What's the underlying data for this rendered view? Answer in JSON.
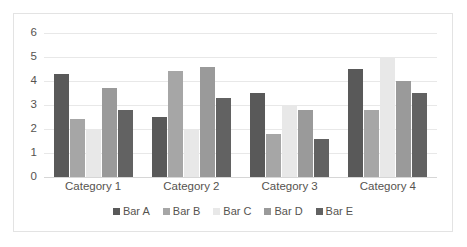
{
  "chart_data": {
    "type": "bar",
    "title": "",
    "subtitle": "",
    "xlabel": "",
    "ylabel": "",
    "ylim": [
      0,
      6
    ],
    "yticks": [
      "0",
      "1",
      "2",
      "3",
      "4",
      "5",
      "6"
    ],
    "grid": true,
    "legend_position": "bottom",
    "categories": [
      "Category 1",
      "Category 2",
      "Category 3",
      "Category 4"
    ],
    "series": [
      {
        "name": "Bar A",
        "color": "#595959",
        "values": [
          4.3,
          2.5,
          3.5,
          4.5
        ]
      },
      {
        "name": "Bar B",
        "color": "#a6a6a6",
        "values": [
          2.4,
          4.4,
          1.8,
          2.8
        ]
      },
      {
        "name": "Bar C",
        "color": "#e8e8e8",
        "values": [
          2.0,
          2.0,
          3.0,
          5.0
        ]
      },
      {
        "name": "Bar D",
        "color": "#9a9a9a",
        "values": [
          3.7,
          4.6,
          2.8,
          4.0
        ]
      },
      {
        "name": "Bar E",
        "color": "#626262",
        "values": [
          2.8,
          3.3,
          1.6,
          3.5
        ]
      }
    ]
  },
  "frame": {
    "border_color": "#e3e3e3",
    "background": "#ffffff"
  }
}
